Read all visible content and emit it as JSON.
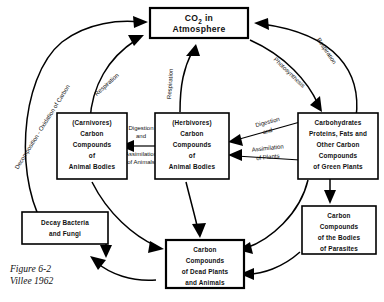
{
  "figure": {
    "caption_line1": "Figure 6-2",
    "caption_line2": "Villee 1962",
    "diagram_title": "Carbon Cycle"
  },
  "nodes": {
    "atmosphere": {
      "line1": "CO2  in",
      "line2": "Atmosphere"
    },
    "green_plants": {
      "line1": "Carbohydrates",
      "line2": "Proteins, Fats and",
      "line3": "Other Carbon",
      "line4": "Compounds",
      "line5": "of Green Plants"
    },
    "herbivores": {
      "line1": "(Herbivores)",
      "line2": "Carbon",
      "line3": "Compounds",
      "line4": "of",
      "line5": "Animal  Bodies"
    },
    "carnivores": {
      "line1": "(Carnivores)",
      "line2": "Carbon",
      "line3": "Compounds",
      "line4": "of",
      "line5": "Animal  Bodies"
    },
    "parasites": {
      "line1": "Carbon",
      "line2": "Compounds",
      "line3": "of the Bodies",
      "line4": "of Parasites"
    },
    "dead_matter": {
      "line1": "Carbon",
      "line2": "Compounds",
      "line3": "of Dead Plants",
      "line4": "and Animals"
    },
    "decay": {
      "line1": "Decay  Bacteria",
      "line2": "and  Fungi"
    }
  },
  "edge_labels": {
    "decomposition": "Decomposition - Oxidation of Carbon",
    "respiration_left": "Respiration",
    "respiration_center": "Respiration",
    "respiration_right": "Respiration",
    "photosynthesis": "Photosynthesis",
    "digestion_animals_line1": "Digestion",
    "digestion_animals_line2": "and",
    "assimilation_animals_line1": "Assimilation",
    "assimilation_animals_line2": "of Animals",
    "digestion_plants_line1": "Digestion",
    "digestion_plants_line2": "and",
    "assimilation_plants_line1": "Assimilation",
    "assimilation_plants_line2": "of Plants"
  },
  "colors": {
    "ink": "#000000",
    "paper": "#ffffff"
  }
}
